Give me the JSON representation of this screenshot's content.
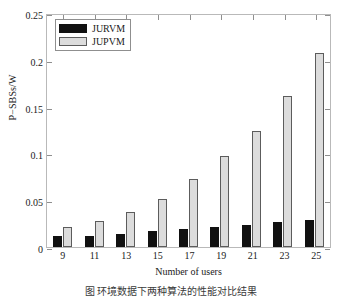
{
  "chart_data": {
    "type": "bar",
    "title": "",
    "xlabel": "Number of users",
    "ylabel": "P−SBSs/W",
    "categories": [
      "9",
      "11",
      "13",
      "15",
      "17",
      "19",
      "21",
      "23",
      "25"
    ],
    "series": [
      {
        "name": "JURVM",
        "color": "#111111",
        "values": [
          0.012,
          0.012,
          0.014,
          0.017,
          0.019,
          0.021,
          0.024,
          0.027,
          0.029
        ]
      },
      {
        "name": "JUPVM",
        "color": "#dcdcdc",
        "values": [
          0.021,
          0.028,
          0.037,
          0.051,
          0.073,
          0.097,
          0.124,
          0.161,
          0.207
        ]
      }
    ],
    "ylim": [
      0,
      0.25
    ],
    "yticks": [
      "0",
      "0.05",
      "0.1",
      "0.15",
      "0.2",
      "0.25"
    ],
    "ytick_values": [
      0,
      0.05,
      0.1,
      0.15,
      0.2,
      0.25
    ],
    "grid": false,
    "legend_position": "top-left"
  },
  "caption": {
    "text": "图  环境数据下两种算法的性能对比结果"
  }
}
